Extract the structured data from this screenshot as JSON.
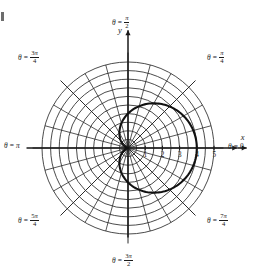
{
  "figure": {
    "kind": "polar-coordinate-plot",
    "background_color": "#ffffff",
    "ink_color": "#1a1a1a",
    "grid_color": "#2b2b2b",
    "curve_color": "#111111",
    "corner_mark_present": true
  },
  "axes": {
    "x_axis_name": "x",
    "y_axis_name": "y",
    "theta_symbol": "θ",
    "pi_symbol": "π",
    "equals": "=",
    "origin_px": {
      "x": 128,
      "y": 148
    },
    "unit_px": 17.2,
    "radial_max": 5
  },
  "radial_ticks": {
    "labels": [
      "1",
      "2",
      "3",
      "4",
      "5"
    ],
    "values": [
      1,
      2,
      3,
      4,
      5
    ]
  },
  "angle_labels": [
    {
      "name": "theta-0",
      "theta_deg": 0,
      "numerator": "",
      "denominator": "",
      "plain": "π",
      "is_fraction": false,
      "zero": true,
      "text": "0"
    },
    {
      "name": "theta-pi-4",
      "theta_deg": 45,
      "numerator": "π",
      "denominator": "4",
      "is_fraction": true
    },
    {
      "name": "theta-pi-2",
      "theta_deg": 90,
      "numerator": "π",
      "denominator": "2",
      "is_fraction": true
    },
    {
      "name": "theta-3pi-4",
      "theta_deg": 135,
      "numerator": "3π",
      "denominator": "4",
      "is_fraction": true
    },
    {
      "name": "theta-pi",
      "theta_deg": 180,
      "plain": "π",
      "is_fraction": false
    },
    {
      "name": "theta-5pi-4",
      "theta_deg": 225,
      "numerator": "5π",
      "denominator": "4",
      "is_fraction": true
    },
    {
      "name": "theta-3pi-2",
      "theta_deg": 270,
      "numerator": "3π",
      "denominator": "2",
      "is_fraction": true
    },
    {
      "name": "theta-7pi-4",
      "theta_deg": 315,
      "numerator": "7π",
      "denominator": "4",
      "is_fraction": true
    }
  ],
  "chart_data": {
    "type": "line",
    "coordinate_system": "polar",
    "title": "",
    "xlabel": "x",
    "ylabel": "y",
    "grid": true,
    "grid_circles_r": [
      0.5,
      1,
      1.5,
      2,
      2.5,
      3,
      3.5,
      4,
      4.5,
      5
    ],
    "grid_spokes_deg": [
      0,
      15,
      30,
      45,
      60,
      75,
      90,
      105,
      120,
      135,
      150,
      165,
      180,
      195,
      210,
      225,
      240,
      255,
      270,
      285,
      300,
      315,
      330,
      345
    ],
    "rlim": [
      0,
      5
    ],
    "rticks": [
      1,
      2,
      3,
      4,
      5
    ],
    "theta_tick_labels": [
      "θ = 0",
      "θ = π/4",
      "θ = π/2",
      "θ = 3π/4",
      "θ = π",
      "θ = 5π/4",
      "θ = 3π/2",
      "θ = 7π/4"
    ],
    "legend": [],
    "series": [
      {
        "name": "cardioid",
        "equation": "r = 2(1 + cos θ)",
        "r_max": 4,
        "theta_deg": [
          0,
          10,
          20,
          30,
          40,
          50,
          60,
          70,
          80,
          90,
          100,
          110,
          120,
          130,
          140,
          150,
          160,
          170,
          180,
          190,
          200,
          210,
          220,
          230,
          240,
          250,
          260,
          270,
          280,
          290,
          300,
          310,
          320,
          330,
          340,
          350,
          360
        ],
        "r": [
          4.0,
          3.97,
          3.88,
          3.73,
          3.53,
          3.29,
          3.0,
          2.68,
          2.35,
          2.0,
          1.65,
          1.32,
          1.0,
          0.71,
          0.47,
          0.27,
          0.12,
          0.03,
          0.0,
          0.03,
          0.12,
          0.27,
          0.47,
          0.71,
          1.0,
          1.32,
          1.65,
          2.0,
          2.35,
          2.68,
          3.0,
          3.29,
          3.53,
          3.73,
          3.88,
          3.97,
          4.0
        ]
      }
    ]
  }
}
